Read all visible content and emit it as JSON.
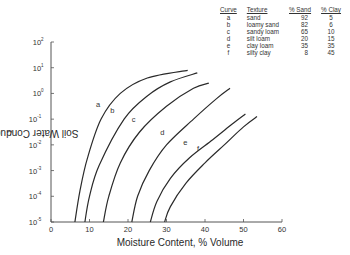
{
  "chart_data": {
    "type": "line",
    "title": "",
    "xlabel": "Moisture Content, % Volume",
    "ylabel": "Soil Water Conductivity, cm-hr",
    "ylabel_superscript": "-1",
    "xlim": [
      0,
      60
    ],
    "ylim_log10": [
      -5,
      2
    ],
    "yscale": "log",
    "x_ticks": [
      0,
      10,
      20,
      30,
      40,
      50,
      60
    ],
    "y_ticks_exponents": [
      2,
      1,
      0,
      -1,
      -2,
      -3,
      -4,
      -5
    ],
    "grid": false,
    "legend_position": "top-right table",
    "series": [
      {
        "name": "a",
        "texture": "sand",
        "x": [
          6.2,
          7.5,
          9.5,
          13.0,
          18.0,
          25.0,
          35.5
        ],
        "log10_y": [
          -5,
          -3.8,
          -2.5,
          -1.0,
          0.0,
          0.6,
          0.9
        ],
        "label_at": [
          13.8,
          -0.6
        ]
      },
      {
        "name": "b",
        "texture": "loamy sand",
        "x": [
          8.8,
          10.0,
          12.5,
          19.0,
          25.0,
          31.0,
          38.0
        ],
        "log10_y": [
          -5,
          -4.0,
          -2.8,
          -1.0,
          -0.1,
          0.45,
          0.8
        ],
        "label_at": [
          17.5,
          -0.85
        ]
      },
      {
        "name": "c",
        "texture": "sandy loam",
        "x": [
          13.6,
          15.0,
          18.0,
          23.0,
          30.0,
          37.0,
          41.0
        ],
        "log10_y": [
          -5,
          -4.0,
          -2.7,
          -1.5,
          -0.5,
          0.2,
          0.4
        ],
        "label_at": [
          23.0,
          -1.2
        ]
      },
      {
        "name": "d",
        "texture": "silt loam",
        "x": [
          21.0,
          22.5,
          25.5,
          30.0,
          37.0,
          43.0,
          46.5
        ],
        "log10_y": [
          -5,
          -4.0,
          -3.0,
          -2.0,
          -1.0,
          -0.2,
          0.2
        ],
        "label_at": [
          30.5,
          -1.7
        ]
      },
      {
        "name": "e",
        "texture": "clay loam",
        "x": [
          25.8,
          27.5,
          31.0,
          36.0,
          42.0,
          47.0,
          50.5
        ],
        "log10_y": [
          -5,
          -4.2,
          -3.3,
          -2.5,
          -1.8,
          -1.2,
          -0.8
        ],
        "label_at": [
          36.5,
          -2.1
        ]
      },
      {
        "name": "f",
        "texture": "silty clay",
        "x": [
          29.5,
          31.0,
          35.0,
          40.0,
          45.0,
          50.0,
          53.5
        ],
        "log10_y": [
          -5,
          -4.4,
          -3.5,
          -2.7,
          -2.0,
          -1.3,
          -0.9
        ],
        "label_at": [
          39.5,
          -2.3
        ]
      }
    ]
  },
  "legend": {
    "headers": {
      "curve": "Curve",
      "texture": "Texture",
      "sand": "% Sand",
      "clay": "% Clay"
    },
    "rows": [
      {
        "curve": "a",
        "texture": "sand",
        "sand": "92",
        "clay": "5"
      },
      {
        "curve": "b",
        "texture": "loamy sand",
        "sand": "82",
        "clay": "6"
      },
      {
        "curve": "c",
        "texture": "sandy loam",
        "sand": "65",
        "clay": "10"
      },
      {
        "curve": "d",
        "texture": "silt loam",
        "sand": "20",
        "clay": "15"
      },
      {
        "curve": "e",
        "texture": "clay loam",
        "sand": "35",
        "clay": "35"
      },
      {
        "curve": "f",
        "texture": "silty clay",
        "sand": "8",
        "clay": "45"
      }
    ]
  },
  "colors": {
    "line": "#2a2a2a",
    "axis": "#555555",
    "text": "#333333"
  }
}
